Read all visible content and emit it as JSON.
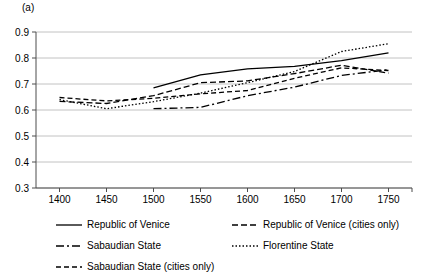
{
  "figure": {
    "panel_label": "(a)"
  },
  "chart_data": {
    "type": "line",
    "title": "",
    "subtitle": "",
    "xlabel": "",
    "ylabel": "",
    "xlim": [
      1375,
      1775
    ],
    "ylim": [
      0.3,
      0.9
    ],
    "x_ticks": [
      1400,
      1450,
      1500,
      1550,
      1600,
      1650,
      1700,
      1750
    ],
    "x_tick_labels": [
      "1400",
      "1450",
      "1500",
      "1550",
      "1600",
      "1650",
      "1700",
      "1750"
    ],
    "y_ticks": [
      0.3,
      0.4,
      0.5,
      0.6,
      0.7,
      0.8,
      0.9
    ],
    "y_tick_labels": [
      "0.3",
      "0.4",
      "0.5",
      "0.6",
      "0.7",
      "0.8",
      "0.9"
    ],
    "grid": true,
    "grid_axis": "y",
    "legend_position": "bottom",
    "series": [
      {
        "name": "Republic of Venice",
        "style": "solid",
        "dash": "none",
        "color": "#000000",
        "x": [
          1500,
          1550,
          1600,
          1650,
          1700,
          1750
        ],
        "values": [
          0.685,
          0.735,
          0.758,
          0.768,
          0.79,
          0.82
        ]
      },
      {
        "name": "Republic of Venice (cities only)",
        "style": "dashed",
        "dash": "6,3",
        "color": "#000000",
        "x": [
          1400,
          1450,
          1500,
          1550,
          1600,
          1650,
          1700,
          1750
        ],
        "values": [
          0.633,
          0.625,
          0.655,
          0.705,
          0.712,
          0.74,
          0.772,
          0.742
        ]
      },
      {
        "name": "Sabaudian State",
        "style": "dash-dot",
        "dash": "8,3,2,3",
        "color": "#000000",
        "x": [
          1500,
          1550,
          1600,
          1650,
          1700,
          1750
        ],
        "values": [
          0.605,
          0.61,
          0.655,
          0.688,
          0.733,
          0.755
        ]
      },
      {
        "name": "Florentine State",
        "style": "dotted",
        "dash": "1.5,2",
        "color": "#000000",
        "x": [
          1400,
          1450,
          1500,
          1550,
          1600,
          1650,
          1700,
          1750
        ],
        "values": [
          0.64,
          0.605,
          0.632,
          0.665,
          0.705,
          0.748,
          0.825,
          0.855
        ]
      },
      {
        "name": "Sabaudian State (cities only)",
        "style": "dashed-short",
        "dash": "5,3",
        "color": "#000000",
        "x": [
          1400,
          1450,
          1500,
          1550,
          1600,
          1650,
          1700,
          1750
        ],
        "values": [
          0.648,
          0.635,
          0.645,
          0.662,
          0.675,
          0.722,
          0.762,
          0.752
        ]
      }
    ]
  },
  "legend": {
    "entries": [
      {
        "label": "Republic of Venice",
        "style": "solid"
      },
      {
        "label": "Republic of Venice (cities only)",
        "style": "dashed"
      },
      {
        "label": "Sabaudian State",
        "style": "dash-dot"
      },
      {
        "label": "Florentine State",
        "style": "dotted"
      },
      {
        "label": "Sabaudian State (cities only)",
        "style": "dashed-short"
      }
    ]
  }
}
